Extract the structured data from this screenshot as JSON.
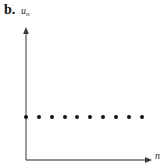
{
  "figure": {
    "panel_label": "b.",
    "width": 163,
    "height": 166,
    "background": "#ffffff"
  },
  "axes": {
    "color": "#6e6e6e",
    "line_width": 1.4,
    "origin_x": 26,
    "origin_y": 160,
    "y_axis_top": 28,
    "x_axis_right": 150,
    "arrow_style": "solid-triangle"
  },
  "chart_data": {
    "type": "scatter",
    "title": "b.",
    "xlabel": "n",
    "ylabel": "u_n",
    "x": [
      1,
      2,
      3,
      4,
      5,
      6,
      7,
      8,
      9,
      10
    ],
    "values": [
      1,
      1,
      1,
      1,
      1,
      1,
      1,
      1,
      1,
      1
    ],
    "series": [
      {
        "name": "u_n",
        "values": [
          1,
          1,
          1,
          1,
          1,
          1,
          1,
          1,
          1,
          1
        ]
      }
    ],
    "tick_labels": {
      "x": [],
      "y": []
    },
    "xlim": [
      0,
      11
    ],
    "ylim": [
      0,
      2.1
    ],
    "grid": false,
    "legend": false,
    "marker_color": "#141414",
    "marker_size": 4
  },
  "plot_points_px": {
    "dot_y": 117,
    "dot_x": [
      26,
      39,
      52,
      65,
      77,
      90,
      103,
      116,
      129,
      142
    ]
  }
}
